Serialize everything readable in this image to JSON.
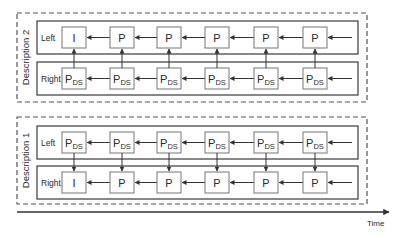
{
  "colors": {
    "frame_outer": "#555555",
    "frame_row": "#3a3a3a",
    "box_border": "#777777",
    "arrow": "#333333",
    "text": "#2a2a2a"
  },
  "time_axis": {
    "label": "Time"
  },
  "descriptions": [
    {
      "label": "Description 2",
      "rows": [
        {
          "label": "Left",
          "frames": [
            "I",
            "P",
            "P",
            "P",
            "P",
            "P"
          ]
        },
        {
          "label": "Right",
          "frames": [
            "PDS",
            "PDS",
            "PDS",
            "PDS",
            "PDS",
            "PDS"
          ]
        }
      ],
      "inter_row_arrow": "Right->Left"
    },
    {
      "label": "Description 1",
      "rows": [
        {
          "label": "Left",
          "frames": [
            "PDS",
            "PDS",
            "PDS",
            "PDS",
            "PDS",
            "PDS"
          ]
        },
        {
          "label": "Right",
          "frames": [
            "I",
            "P",
            "P",
            "P",
            "P",
            "P"
          ]
        }
      ],
      "inter_row_arrow": "Left->Right"
    }
  ],
  "legend_note": {
    "I": "I",
    "P": "P",
    "PDS": {
      "main": "P",
      "sub": "DS"
    }
  }
}
